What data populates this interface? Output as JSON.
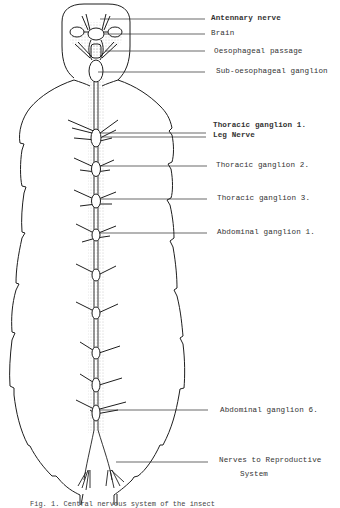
{
  "figure": {
    "type": "anatomical-diagram",
    "line_color": "#1e1e1e",
    "stipple_color": "#6a6a6a",
    "label_color": "#333333",
    "labels": [
      {
        "id": "antennary-nerve",
        "text": "Antennary nerve",
        "x": 211,
        "y": 14
      },
      {
        "id": "brain",
        "text": "Brain",
        "x": 211,
        "y": 30
      },
      {
        "id": "oesophageal-passage",
        "text": "Oesophageal passage",
        "x": 214,
        "y": 49
      },
      {
        "id": "sub-oesophageal-ganglion",
        "text": "Sub-oesophageal ganglion",
        "x": 216,
        "y": 69
      },
      {
        "id": "thoracic-ganglion-1",
        "text": "Thoracic ganglion 1.",
        "x": 213,
        "y": 122
      },
      {
        "id": "leg-nerve",
        "text": "Leg Nerve",
        "x": 213,
        "y": 132
      },
      {
        "id": "thoracic-ganglion-2",
        "text": "Thoracic ganglion 2.",
        "x": 216,
        "y": 161
      },
      {
        "id": "thoracic-ganglion-3",
        "text": "Thoracic ganglion 3.",
        "x": 217,
        "y": 194
      },
      {
        "id": "abdominal-ganglion-1",
        "text": "Abdominal ganglion 1.",
        "x": 217,
        "y": 229
      },
      {
        "id": "abdominal-ganglion-6",
        "text": "Abdominal ganglion 6.",
        "x": 220,
        "y": 410
      },
      {
        "id": "nerves-to-reproductive-system-1",
        "text": "Nerves to Reproductive",
        "x": 219,
        "y": 460
      },
      {
        "id": "nerves-to-reproductive-system-2",
        "text": "System",
        "x": 240,
        "y": 474
      }
    ],
    "caption": "Fig. 1. Central nervous system of the insect"
  }
}
